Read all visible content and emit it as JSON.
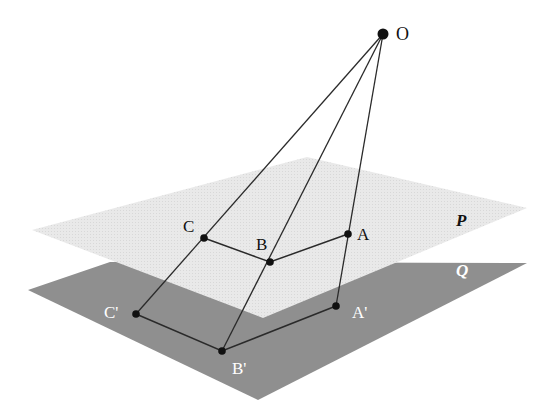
{
  "diagram": {
    "colors": {
      "background": "#ffffff",
      "plane_p": "#e6e6e6",
      "plane_q": "#8f8f8f",
      "line": "#2a2a2a",
      "point": "#111111",
      "label_dark": "#111111",
      "label_light": "#ffffff"
    },
    "center": {
      "label": "O",
      "x": 383,
      "y": 34
    },
    "planes": [
      {
        "label": "P",
        "label_x": 456,
        "label_y": 226,
        "points": [
          [
            307,
            157
          ],
          [
            527,
            208
          ],
          [
            263,
            318
          ],
          [
            32,
            230
          ]
        ]
      },
      {
        "label": "Q",
        "label_x": 456,
        "label_y": 276,
        "points": [
          [
            110,
            262
          ],
          [
            527,
            263
          ],
          [
            258,
            400
          ],
          [
            28,
            290
          ]
        ]
      }
    ],
    "points_p": [
      {
        "label": "C",
        "x": 204,
        "y": 238,
        "label_x": 183,
        "label_y": 232
      },
      {
        "label": "B",
        "x": 270,
        "y": 262,
        "label_x": 256,
        "label_y": 250
      },
      {
        "label": "A",
        "x": 348,
        "y": 234,
        "label_x": 357,
        "label_y": 240
      }
    ],
    "points_q": [
      {
        "label": "C'",
        "x": 136,
        "y": 314,
        "label_x": 104,
        "label_y": 318
      },
      {
        "label": "B'",
        "x": 222,
        "y": 351,
        "label_x": 232,
        "label_y": 374
      },
      {
        "label": "A'",
        "x": 336,
        "y": 306,
        "label_x": 352,
        "label_y": 318
      }
    ]
  }
}
